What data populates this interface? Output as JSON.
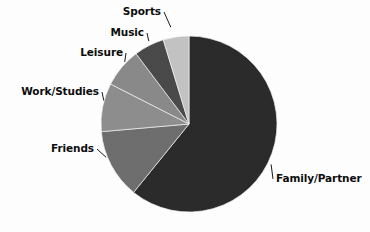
{
  "chart_data": {
    "type": "pie",
    "title": "",
    "xlabel": "",
    "ylabel": "",
    "legend_position": "none",
    "grid": false,
    "start_angle_deg": 0,
    "direction": "clockwise",
    "center": {
      "x": 189,
      "y": 124
    },
    "radius": 88,
    "categories": [
      "Family/Partner",
      "Friends",
      "Work/Studies",
      "Leisure",
      "Music",
      "Sports"
    ],
    "values": [
      60.8,
      12.8,
      8.9,
      7.2,
      5.6,
      4.7
    ],
    "slices": [
      {
        "label": "Family/Partner",
        "value": 60.8,
        "angle_deg": 219.0,
        "color": "#2b2b2b",
        "label_side": "right"
      },
      {
        "label": "Friends",
        "value": 12.8,
        "angle_deg": 46.0,
        "color": "#6e6e6e",
        "label_side": "left"
      },
      {
        "label": "Work/Studies",
        "value": 8.9,
        "angle_deg": 32.0,
        "color": "#8e8e8e",
        "label_side": "left"
      },
      {
        "label": "Leisure",
        "value": 7.2,
        "angle_deg": 26.0,
        "color": "#8a8a8a",
        "label_side": "left"
      },
      {
        "label": "Music",
        "value": 5.6,
        "angle_deg": 20.0,
        "color": "#4a4a4a",
        "label_side": "left"
      },
      {
        "label": "Sports",
        "value": 4.7,
        "angle_deg": 17.0,
        "color": "#c3c3c3",
        "label_side": "left"
      }
    ],
    "labels": [
      {
        "text": "Sports",
        "x": 161,
        "y": 15,
        "anchor": "end"
      },
      {
        "text": "Music",
        "x": 144,
        "y": 36,
        "anchor": "end"
      },
      {
        "text": "Leisure",
        "x": 123,
        "y": 56,
        "anchor": "end"
      },
      {
        "text": "Work/Studies",
        "x": 99,
        "y": 95,
        "anchor": "end"
      },
      {
        "text": "Friends",
        "x": 94,
        "y": 152,
        "anchor": "end"
      },
      {
        "text": "Family/Partner",
        "x": 276,
        "y": 182,
        "anchor": "start"
      }
    ],
    "colors": {
      "background": "#ffffff",
      "text": "#0d0d0d",
      "stroke": "#f2f2f2"
    }
  }
}
